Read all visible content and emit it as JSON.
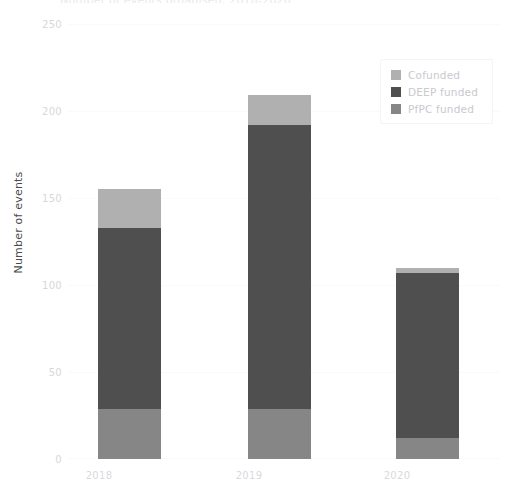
{
  "chart_data": {
    "type": "bar",
    "stacked": true,
    "title": "Number of events organised, 2018-2020",
    "xlabel": "",
    "ylabel": "Number of events",
    "categories": [
      "2018",
      "2019",
      "2020"
    ],
    "ylim": [
      0,
      250
    ],
    "yticks": [
      0,
      50,
      100,
      150,
      200,
      250
    ],
    "grid": true,
    "legend_position": "top-right",
    "series": [
      {
        "name": "Cofunded",
        "color": "#b0b0b0",
        "values": [
          22,
          17,
          3
        ]
      },
      {
        "name": "DEEP funded",
        "color": "#4f4f4f",
        "values": [
          104,
          163,
          95
        ]
      },
      {
        "name": "PfPC funded",
        "color": "#868686",
        "values": [
          29,
          29,
          12
        ]
      }
    ],
    "totals": [
      155,
      209,
      110
    ],
    "stack_order_bottom_to_top": [
      "PfPC funded",
      "DEEP funded",
      "Cofunded"
    ]
  },
  "axes": {
    "y_title": "Number of events",
    "y_tick_labels": [
      "250",
      "200",
      "150",
      "100",
      "50",
      "0"
    ],
    "x_tick_labels": [
      "2018",
      "2019",
      "2020"
    ]
  },
  "legend": {
    "items": [
      {
        "label": "Cofunded",
        "color": "#b0b0b0"
      },
      {
        "label": "DEEP funded",
        "color": "#4f4f4f"
      },
      {
        "label": "PfPC funded",
        "color": "#868686"
      }
    ]
  },
  "colors": {
    "cofunded": "#b0b0b0",
    "deep_funded": "#4f4f4f",
    "pfpc_funded": "#868686",
    "tick_text": "#d7d7db",
    "axis_title": "#4a4a4a",
    "gridline": "#fafafb",
    "background": "#ffffff"
  }
}
